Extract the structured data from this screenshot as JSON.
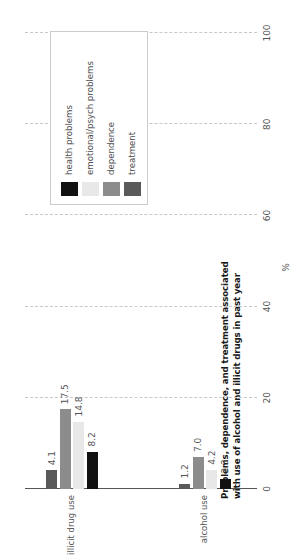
{
  "chart_data": {
    "type": "bar",
    "orientation": "horizontal",
    "title": "Problems, dependence, and treatment associated with use of alcohol and illicit drugs in past year",
    "title_lines": [
      "Problems, dependence, and treatment associated",
      "with use of alcohol and illicit drugs in past year"
    ],
    "xlabel": "%",
    "ylabel": "",
    "xlim": [
      0,
      100
    ],
    "xticks": [
      0,
      20,
      40,
      60,
      80,
      100
    ],
    "xtick_labels": [
      "0",
      "20",
      "40",
      "60",
      "80",
      "100"
    ],
    "grid": true,
    "grid_style": "dashed-vertical",
    "legend_position": "upper-left",
    "categories": [
      "alcohol use",
      "illicit drug use"
    ],
    "series": [
      {
        "name": "health problems",
        "color": "#111111",
        "values": [
          2.3,
          8.2
        ],
        "labels": [
          "2.3",
          "8.2"
        ]
      },
      {
        "name": "emotional/psych problems",
        "color": "#e8e8e8",
        "values": [
          4.2,
          14.8
        ],
        "labels": [
          "4.2",
          "14.8"
        ]
      },
      {
        "name": "dependence",
        "color": "#8c8c8c",
        "values": [
          7.0,
          17.5
        ],
        "labels": [
          "7.0",
          "17.5"
        ]
      },
      {
        "name": "treatment",
        "color": "#5a5a5a",
        "values": [
          1.2,
          4.1
        ],
        "labels": [
          "1.2",
          "4.1"
        ]
      }
    ]
  },
  "legend": {
    "items": [
      {
        "label": "health problems",
        "color": "#111111"
      },
      {
        "label": "emotional/psych problems",
        "color": "#e8e8e8"
      },
      {
        "label": "dependence",
        "color": "#8c8c8c"
      },
      {
        "label": "treatment",
        "color": "#5a5a5a"
      }
    ]
  },
  "axis": {
    "value_axis_label": "%",
    "ticks": [
      "0",
      "20",
      "40",
      "60",
      "80",
      "100"
    ]
  }
}
